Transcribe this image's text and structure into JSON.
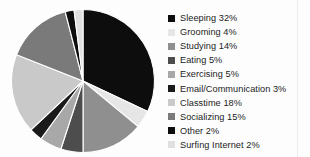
{
  "chart_data": {
    "type": "pie",
    "title": "",
    "legend_position": "right",
    "start_angle": 0,
    "direction": "clockwise",
    "categories": [
      "Sleeping",
      "Grooming",
      "Studying",
      "Eating",
      "Exercising",
      "Email/Communication",
      "Classtime",
      "Socializing",
      "Other",
      "Surfing Internet"
    ],
    "values": [
      32,
      4,
      14,
      5,
      5,
      3,
      18,
      15,
      2,
      2
    ],
    "unit": "%",
    "colors": [
      "#0d0d0d",
      "#e6e6e6",
      "#8f8f8f",
      "#4d4d4d",
      "#a8a8a8",
      "#1a1a1a",
      "#c9c9c9",
      "#7a7a7a",
      "#0d0d0d",
      "#e0e0e0"
    ],
    "slice_border_color": "#ffffff"
  },
  "legend": {
    "items": [
      {
        "label": "Sleeping 32%",
        "color": "#0d0d0d"
      },
      {
        "label": "Grooming 4%",
        "color": "#e6e6e6"
      },
      {
        "label": "Studying 14%",
        "color": "#8f8f8f"
      },
      {
        "label": "Eating 5%",
        "color": "#4d4d4d"
      },
      {
        "label": "Exercising 5%",
        "color": "#a8a8a8"
      },
      {
        "label": "Email/Communication 3%",
        "color": "#1a1a1a"
      },
      {
        "label": "Classtime 18%",
        "color": "#c9c9c9"
      },
      {
        "label": "Socializing 15%",
        "color": "#7a7a7a"
      },
      {
        "label": "Other 2%",
        "color": "#0d0d0d"
      },
      {
        "label": "Surfing Internet 2%",
        "color": "#e0e0e0"
      }
    ]
  }
}
